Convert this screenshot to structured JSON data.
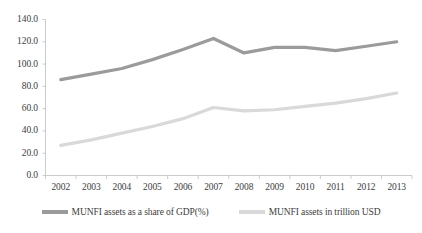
{
  "chart_data": {
    "type": "line",
    "title": "",
    "xlabel": "",
    "ylabel": "",
    "categories": [
      "2002",
      "2003",
      "2004",
      "2005",
      "2006",
      "2007",
      "2008",
      "2009",
      "2010",
      "2011",
      "2012",
      "2013"
    ],
    "ylim": [
      0,
      140
    ],
    "ytick_labels": [
      "140.0",
      "120.0",
      "100.0",
      "80.0",
      "60.0",
      "40.0",
      "20.0",
      "0.0"
    ],
    "ytick_values": [
      140,
      120,
      100,
      80,
      60,
      40,
      20,
      0
    ],
    "grid": false,
    "legend_position": "bottom",
    "series": [
      {
        "name": "MUNFI assets as a share of GDP(%)",
        "color": "#9b9b9b",
        "values": [
          86,
          91,
          96,
          104,
          113,
          123,
          110,
          115,
          115,
          112,
          116,
          120
        ]
      },
      {
        "name": "MUNFI assets in trillion USD",
        "color": "#d9d9d9",
        "values": [
          27,
          32,
          38,
          44,
          51,
          61,
          58,
          59,
          62,
          65,
          69,
          74
        ]
      }
    ]
  },
  "legend": {
    "items": [
      {
        "label": "MUNFI assets as a share of GDP(%)",
        "color": "#9b9b9b"
      },
      {
        "label": "MUNFI assets in trillion USD",
        "color": "#d9d9d9"
      }
    ]
  },
  "axes": {
    "axis_color": "#bfbfbf"
  }
}
